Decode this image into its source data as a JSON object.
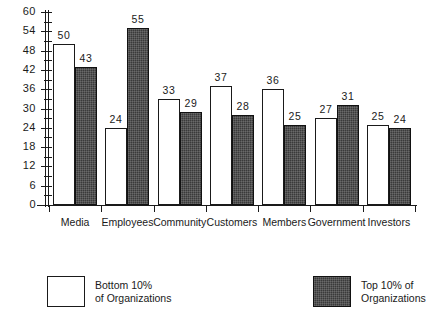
{
  "chart_data": {
    "type": "bar",
    "title": "",
    "subtitle": "",
    "xlabel": "",
    "ylabel": "",
    "grid": false,
    "legend_position": "bottom",
    "categories": [
      "Media",
      "Employees",
      "Community",
      "Customers",
      "Members",
      "Government",
      "Investors"
    ],
    "series": [
      {
        "name": "Bottom 10% of Organizations",
        "color": "#ffffff",
        "values": [
          50,
          24,
          33,
          37,
          36,
          27,
          25
        ]
      },
      {
        "name": "Top 10% of Organizations",
        "color": "#3a3a3a",
        "values": [
          43,
          55,
          29,
          28,
          25,
          31,
          24
        ]
      }
    ],
    "ylim": [
      0,
      60
    ],
    "ytick_labels": [
      "0",
      "6",
      "12",
      "18",
      "24",
      "30",
      "36",
      "42",
      "48",
      "54",
      "60"
    ],
    "ytick_values": [
      0,
      6,
      12,
      18,
      24,
      30,
      36,
      42,
      48,
      54,
      60
    ],
    "yminor_tick_values": [
      3,
      9,
      15,
      21,
      27,
      33,
      39,
      45,
      51,
      57
    ],
    "value_labels": [
      "50",
      "43",
      "24",
      "55",
      "33",
      "29",
      "37",
      "28",
      "36",
      "25",
      "27",
      "31",
      "25",
      "24"
    ]
  },
  "legend": {
    "items": [
      {
        "label": "Bottom 10%\nof Organizations",
        "style": "light"
      },
      {
        "label": "Top 10% of\nOrganizations",
        "style": "dark"
      }
    ]
  }
}
